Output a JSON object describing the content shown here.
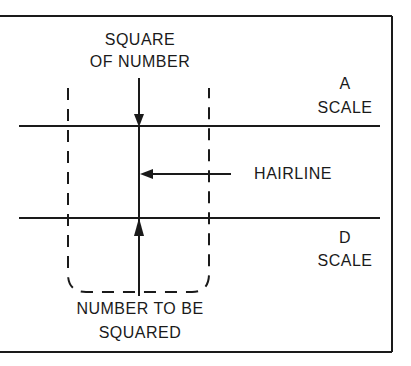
{
  "diagram": {
    "title_top_line1": "SQUARE",
    "title_top_line2": "OF NUMBER",
    "a_scale_line1": "A",
    "a_scale_line2": "SCALE",
    "hairline_label": "HAIRLINE",
    "d_scale_line1": "D",
    "d_scale_line2": "SCALE",
    "bottom_line1": "NUMBER TO BE",
    "bottom_line2": "SQUARED",
    "colors": {
      "ink": "#1a1a1a",
      "background": "#ffffff"
    }
  }
}
